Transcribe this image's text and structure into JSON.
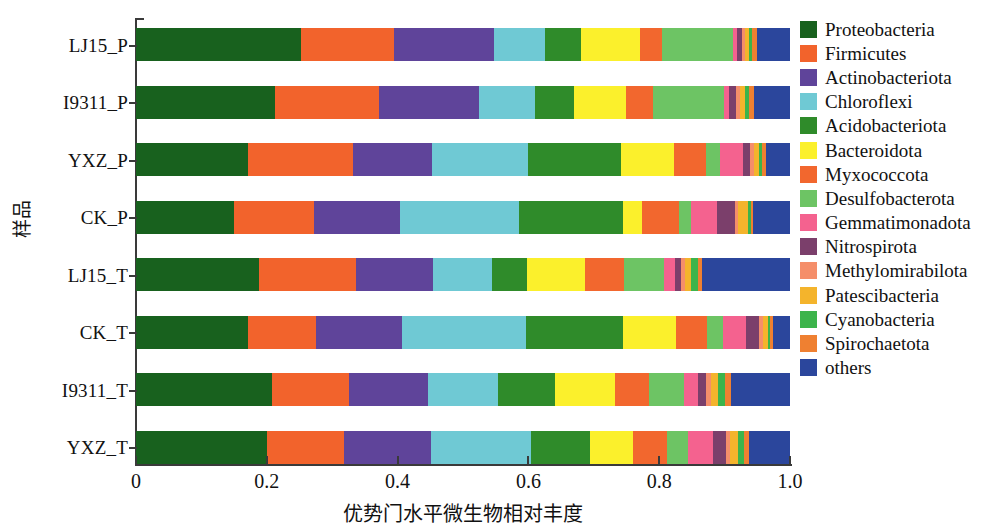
{
  "chart_data": {
    "type": "bar",
    "orientation": "horizontal",
    "stacked": true,
    "normalized": true,
    "title": "",
    "xlabel": "优势门水平微生物相对丰度",
    "ylabel": "样品",
    "xlim": [
      0,
      1.0
    ],
    "xticks": [
      0,
      0.2,
      0.4,
      0.6,
      0.8,
      1.0
    ],
    "xticklabels": [
      "0",
      "0.2",
      "0.4",
      "0.6",
      "0.8",
      "1.0"
    ],
    "grid": false,
    "legend_position": "right",
    "categories": [
      "LJ15_P",
      "I9311_P",
      "YXZ_P",
      "CK_P",
      "LJ15_T",
      "CK_T",
      "I9311_T",
      "YXZ_T"
    ],
    "series": [
      {
        "name": "Proteobacteria",
        "color": "#18611e",
        "values": [
          0.252,
          0.212,
          0.172,
          0.15,
          0.188,
          0.172,
          0.208,
          0.2
        ]
      },
      {
        "name": "Firmicutes",
        "color": "#f2632c",
        "values": [
          0.142,
          0.16,
          0.16,
          0.122,
          0.148,
          0.103,
          0.118,
          0.118
        ]
      },
      {
        "name": "Actinobacteriota",
        "color": "#5f449a",
        "values": [
          0.154,
          0.152,
          0.12,
          0.132,
          0.118,
          0.132,
          0.12,
          0.133
        ]
      },
      {
        "name": "Chloroflexi",
        "color": "#6fc9d4",
        "values": [
          0.078,
          0.086,
          0.148,
          0.182,
          0.09,
          0.19,
          0.108,
          0.153
        ]
      },
      {
        "name": "Acidobacteriota",
        "color": "#2f8b2a",
        "values": [
          0.055,
          0.06,
          0.142,
          0.158,
          0.054,
          0.148,
          0.086,
          0.09
        ]
      },
      {
        "name": "Bacteroidota",
        "color": "#fbf02c",
        "values": [
          0.089,
          0.08,
          0.08,
          0.03,
          0.088,
          0.08,
          0.092,
          0.066
        ]
      },
      {
        "name": "Myxococcota",
        "color": "#f2672e",
        "values": [
          0.035,
          0.04,
          0.05,
          0.057,
          0.06,
          0.048,
          0.052,
          0.052
        ]
      },
      {
        "name": "Desulfobacterota",
        "color": "#6dc464",
        "values": [
          0.108,
          0.109,
          0.021,
          0.017,
          0.061,
          0.024,
          0.054,
          0.032
        ]
      },
      {
        "name": "Gemmatimonadota",
        "color": "#f4628f",
        "values": [
          0.006,
          0.008,
          0.035,
          0.04,
          0.017,
          0.036,
          0.022,
          0.038
        ]
      },
      {
        "name": "Nitrospirota",
        "color": "#7b3f6b",
        "values": [
          0.008,
          0.01,
          0.011,
          0.028,
          0.01,
          0.02,
          0.011,
          0.02
        ]
      },
      {
        "name": "Methylomirabilota",
        "color": "#f58e6a",
        "values": [
          0.005,
          0.007,
          0.006,
          0.005,
          0.006,
          0.006,
          0.009,
          0.006
        ]
      },
      {
        "name": "Patescibacteria",
        "color": "#f4b42c",
        "values": [
          0.006,
          0.008,
          0.008,
          0.015,
          0.008,
          0.007,
          0.01,
          0.013
        ]
      },
      {
        "name": "Cyanobacteria",
        "color": "#3cb44b",
        "values": [
          0.004,
          0.006,
          0.005,
          0.004,
          0.012,
          0.004,
          0.01,
          0.009
        ]
      },
      {
        "name": "Spirochaetota",
        "color": "#ef8031",
        "values": [
          0.008,
          0.007,
          0.006,
          0.004,
          0.006,
          0.004,
          0.01,
          0.008
        ]
      },
      {
        "name": "others",
        "color": "#2b469c",
        "values": [
          0.05,
          0.055,
          0.036,
          0.056,
          0.134,
          0.026,
          0.09,
          0.062
        ]
      }
    ]
  },
  "axes": {
    "y_title": "样品",
    "x_title": "优势门水平微生物相对丰度",
    "x_ticklabels": [
      "0",
      "0.2",
      "0.4",
      "0.6",
      "0.8",
      "1.0"
    ],
    "y_ticklabels": [
      "LJ15_P",
      "I9311_P",
      "YXZ_P",
      "CK_P",
      "LJ15_T",
      "CK_T",
      "I9311_T",
      "YXZ_T"
    ]
  },
  "legend": {
    "items": [
      {
        "label": "Proteobacteria",
        "color": "#18611e"
      },
      {
        "label": "Firmicutes",
        "color": "#f2632c"
      },
      {
        "label": "Actinobacteriota",
        "color": "#5f449a"
      },
      {
        "label": "Chloroflexi",
        "color": "#6fc9d4"
      },
      {
        "label": "Acidobacteriota",
        "color": "#2f8b2a"
      },
      {
        "label": "Bacteroidota",
        "color": "#fbf02c"
      },
      {
        "label": "Myxococcota",
        "color": "#f2672e"
      },
      {
        "label": "Desulfobacterota",
        "color": "#6dc464"
      },
      {
        "label": "Gemmatimonadota",
        "color": "#f4628f"
      },
      {
        "label": "Nitrospirota",
        "color": "#7b3f6b"
      },
      {
        "label": "Methylomirabilota",
        "color": "#f58e6a"
      },
      {
        "label": "Patescibacteria",
        "color": "#f4b42c"
      },
      {
        "label": "Cyanobacteria",
        "color": "#3cb44b"
      },
      {
        "label": "Spirochaetota",
        "color": "#ef8031"
      },
      {
        "label": "others",
        "color": "#2b469c"
      }
    ]
  },
  "style": {
    "axis_color": "#3a3a3a",
    "background": "#ffffff",
    "text_color": "#111111"
  }
}
